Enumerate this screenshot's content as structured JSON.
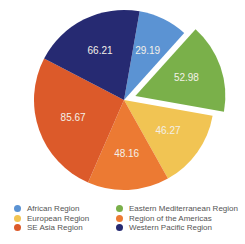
{
  "chart_data": {
    "type": "pie",
    "title": "",
    "categories": [
      "African Region",
      "Eastern Mediterranean Region",
      "European Region",
      "Region of the Americas",
      "SE Asia Region",
      "Western Pacific Region"
    ],
    "values": [
      29.19,
      52.98,
      46.27,
      48.16,
      85.67,
      66.21
    ],
    "colors": [
      "#5b93d3",
      "#7ab04a",
      "#f1c453",
      "#ec7a33",
      "#dc5a2a",
      "#262a72"
    ],
    "exploded": [
      "Eastern Mediterranean Region"
    ],
    "start_angle_deg": 10,
    "direction": "clockwise",
    "data_labels": [
      "29.19",
      "52.98",
      "46.27",
      "48.16",
      "85.67",
      "66.21"
    ],
    "legend_position": "bottom"
  },
  "legend": [
    {
      "label": "African Region",
      "color": "#5b93d3"
    },
    {
      "label": "Eastern Mediterranean Region",
      "color": "#7ab04a"
    },
    {
      "label": "European Region",
      "color": "#f1c453"
    },
    {
      "label": "Region of the Americas",
      "color": "#ec7a33"
    },
    {
      "label": "SE Asia Region",
      "color": "#dc5a2a"
    },
    {
      "label": "Western Pacific Region",
      "color": "#262a72"
    }
  ]
}
